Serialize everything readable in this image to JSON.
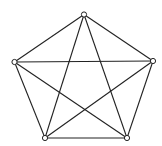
{
  "diagram": {
    "type": "complete-graph",
    "name": "K5",
    "colors": {
      "background": "#ffffff",
      "stroke": "#222222",
      "node_fill": "#ffffff"
    },
    "nodes": [
      {
        "id": "top",
        "x": 84,
        "y": 14.5
      },
      {
        "id": "right",
        "x": 153,
        "y": 61
      },
      {
        "id": "bottom-right",
        "x": 127,
        "y": 138
      },
      {
        "id": "bottom-left",
        "x": 45,
        "y": 138
      },
      {
        "id": "left",
        "x": 14.5,
        "y": 62
      }
    ],
    "edges": [
      [
        "top",
        "right"
      ],
      [
        "top",
        "bottom-right"
      ],
      [
        "top",
        "bottom-left"
      ],
      [
        "top",
        "left"
      ],
      [
        "right",
        "bottom-right"
      ],
      [
        "right",
        "bottom-left"
      ],
      [
        "right",
        "left"
      ],
      [
        "bottom-right",
        "bottom-left"
      ],
      [
        "bottom-right",
        "left"
      ],
      [
        "bottom-left",
        "left"
      ]
    ],
    "node_radius": 2.6
  }
}
